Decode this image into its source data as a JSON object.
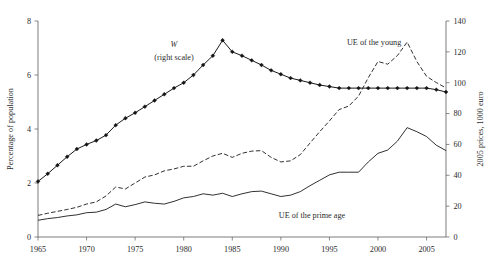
{
  "chart_data": {
    "type": "line",
    "title": "",
    "subtitle": "",
    "xlabel": "",
    "ylabel": "Percentage of population",
    "ylabel_right": "2005 prices, 1000 euro",
    "grid": false,
    "legend_position": "inline-annotations",
    "xlim": [
      1965,
      2007
    ],
    "xticks": [
      1965,
      1970,
      1975,
      1980,
      1985,
      1990,
      1995,
      2000,
      2005
    ],
    "xticklabels": [
      "1965",
      "1970",
      "1975",
      "1980",
      "1985",
      "1990",
      "1995",
      "2000",
      "2005"
    ],
    "ylim": [
      0,
      8
    ],
    "yticks": [
      0,
      2,
      4,
      6,
      8
    ],
    "yticklabels": [
      "0",
      "2",
      "4",
      "6",
      "8"
    ],
    "ylim_right": [
      0,
      140
    ],
    "yticks_right": [
      0,
      20,
      40,
      60,
      80,
      100,
      120,
      140
    ],
    "yticklabels_right": [
      "0",
      "20",
      "40",
      "60",
      "80",
      "100",
      "120",
      "140"
    ],
    "annotations": [
      {
        "text": "W",
        "style": "italic",
        "x": 1979.0,
        "y": 7.05
      },
      {
        "text": "(right scale)",
        "style": "normal",
        "x": 1979.0,
        "y": 6.55
      },
      {
        "text": "UE of the young",
        "style": "normal",
        "x": 1999.6,
        "y": 7.12
      },
      {
        "text": "UE of the prime age",
        "style": "normal",
        "x": 1993.2,
        "y": 0.72
      }
    ],
    "x": [
      1965,
      1966,
      1967,
      1968,
      1969,
      1970,
      1971,
      1972,
      1973,
      1974,
      1975,
      1976,
      1977,
      1978,
      1979,
      1980,
      1981,
      1982,
      1983,
      1984,
      1985,
      1986,
      1987,
      1988,
      1989,
      1990,
      1991,
      1992,
      1993,
      1994,
      1995,
      1996,
      1997,
      1998,
      1999,
      2000,
      2001,
      2002,
      2003,
      2004,
      2005,
      2006,
      2007
    ],
    "series": [
      {
        "name": "W",
        "axis": "right",
        "style": "solid-with-diamond-markers",
        "markers": true,
        "values_right_axis": [
          36.0,
          41.0,
          46.5,
          52.0,
          57.0,
          60.0,
          62.5,
          66.0,
          72.5,
          77.0,
          80.5,
          84.5,
          88.5,
          92.5,
          96.5,
          100.0,
          105.0,
          111.5,
          117.5,
          127.5,
          120.0,
          117.5,
          114.5,
          111.5,
          108.0,
          105.5,
          103.0,
          101.5,
          100.0,
          98.5,
          97.5,
          96.5,
          96.5,
          96.5,
          96.5,
          96.5,
          96.5,
          96.5,
          96.5,
          96.5,
          96.5,
          95.5,
          94.0
        ],
        "values_left_equiv": [
          2.06,
          2.34,
          2.66,
          2.97,
          3.26,
          3.43,
          3.57,
          3.77,
          4.14,
          4.4,
          4.6,
          4.83,
          5.06,
          5.29,
          5.51,
          5.71,
          6.0,
          6.37,
          6.71,
          7.29,
          6.86,
          6.71,
          6.54,
          6.37,
          6.17,
          6.03,
          5.89,
          5.8,
          5.71,
          5.63,
          5.57,
          5.51,
          5.51,
          5.51,
          5.51,
          5.51,
          5.51,
          5.51,
          5.51,
          5.51,
          5.51,
          5.46,
          5.37
        ]
      },
      {
        "name": "UE of the young",
        "axis": "left",
        "style": "dashed",
        "markers": false,
        "values": [
          0.8,
          0.88,
          0.95,
          1.02,
          1.1,
          1.22,
          1.3,
          1.52,
          1.85,
          1.78,
          2.0,
          2.22,
          2.3,
          2.45,
          2.52,
          2.62,
          2.62,
          2.82,
          3.0,
          3.1,
          2.95,
          3.1,
          3.18,
          3.2,
          2.95,
          2.78,
          2.82,
          3.05,
          3.48,
          3.9,
          4.3,
          4.72,
          4.85,
          5.22,
          5.9,
          6.5,
          6.4,
          6.72,
          7.22,
          6.5,
          5.95,
          5.72,
          5.52
        ]
      },
      {
        "name": "UE of the prime age",
        "axis": "left",
        "style": "solid-thin",
        "markers": false,
        "values": [
          0.62,
          0.68,
          0.72,
          0.78,
          0.82,
          0.9,
          0.92,
          1.02,
          1.22,
          1.12,
          1.2,
          1.3,
          1.25,
          1.22,
          1.32,
          1.45,
          1.5,
          1.6,
          1.55,
          1.62,
          1.5,
          1.6,
          1.68,
          1.7,
          1.6,
          1.5,
          1.55,
          1.68,
          1.9,
          2.1,
          2.3,
          2.4,
          2.4,
          2.4,
          2.78,
          3.1,
          3.22,
          3.55,
          4.05,
          3.9,
          3.72,
          3.4,
          3.2
        ]
      }
    ]
  }
}
